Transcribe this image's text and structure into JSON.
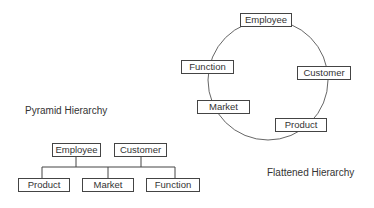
{
  "diagram": {
    "pyramid": {
      "title": "Pyramid Hierarchy",
      "top_nodes": [
        "Employee",
        "Customer"
      ],
      "bottom_nodes": [
        "Product",
        "Market",
        "Function"
      ]
    },
    "flattened": {
      "title": "Flattened Hierarchy",
      "ring_nodes": [
        "Employee",
        "Customer",
        "Product",
        "Market",
        "Function"
      ]
    },
    "colors": {
      "line": "#444444",
      "text": "#333333",
      "background": "#ffffff"
    }
  }
}
